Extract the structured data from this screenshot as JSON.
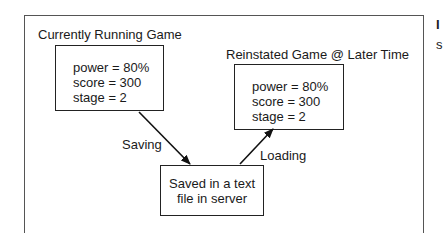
{
  "diagram": {
    "left_group": {
      "title": "Currently Running Game",
      "state": [
        "power = 80%",
        "score = 300",
        "stage = 2"
      ]
    },
    "right_group": {
      "title": "Reinstated Game @ Later Time",
      "state": [
        "power = 80%",
        "score = 300",
        "stage = 2"
      ]
    },
    "storage": {
      "lines": [
        "Saved in a text",
        "file in server"
      ]
    },
    "edges": [
      {
        "from": "left_group",
        "to": "storage",
        "label": "Saving"
      },
      {
        "from": "storage",
        "to": "right_group",
        "label": "Loading"
      }
    ],
    "clipped_margin_text": [
      "I",
      "s"
    ]
  }
}
